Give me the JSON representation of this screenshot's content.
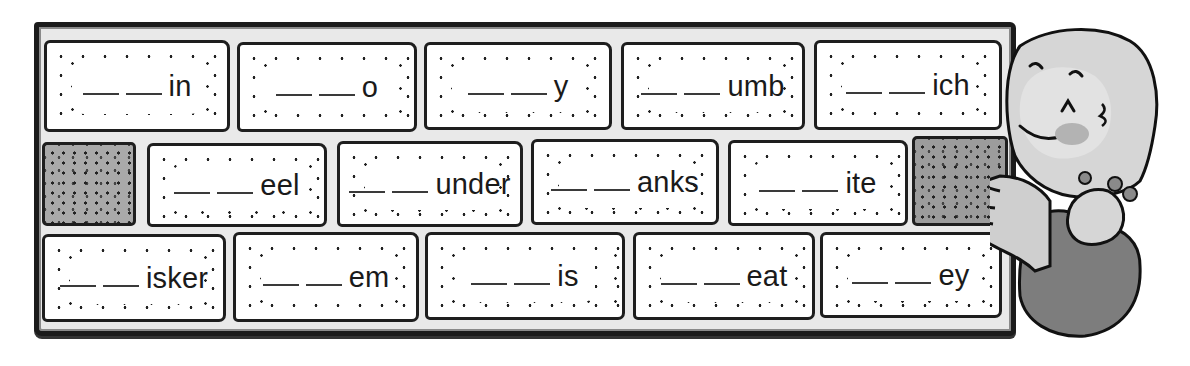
{
  "worksheet": {
    "instruction_blank": "___",
    "rows": [
      {
        "bricks": [
          {
            "suffix": "in"
          },
          {
            "suffix": "o"
          },
          {
            "suffix": "y"
          },
          {
            "suffix": "umb"
          },
          {
            "suffix": "ich"
          }
        ]
      },
      {
        "bricks": [
          {
            "suffix": "eel"
          },
          {
            "suffix": "under"
          },
          {
            "suffix": "anks"
          },
          {
            "suffix": "ite"
          }
        ]
      },
      {
        "bricks": [
          {
            "suffix": "isker"
          },
          {
            "suffix": "em"
          },
          {
            "suffix": "is"
          },
          {
            "suffix": "eat"
          },
          {
            "suffix": "ey"
          }
        ]
      }
    ],
    "blank_count_per_word": 2,
    "illustration": "girl-leaning-on-brick-wall"
  },
  "colors": {
    "ink": "#1a1a1a",
    "brick_fill": "#ffffff",
    "mortar": "#e9e9e9",
    "shaded_brick": "#a9a9a9",
    "girl_skin": "#d4d4d4",
    "girl_dress": "#7a7a7a"
  }
}
